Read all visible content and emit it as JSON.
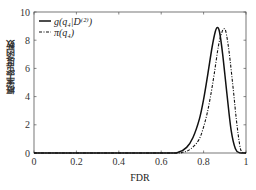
{
  "chart_data": {
    "type": "line",
    "title": "",
    "xlabel": "FDR",
    "ylabel": "概率密度函数",
    "xlim": [
      0,
      1
    ],
    "ylim": [
      0,
      10
    ],
    "xticks": [
      "0",
      "0.2",
      "0.4",
      "0.6",
      "0.8",
      "1"
    ],
    "yticks": [
      "0",
      "2",
      "4",
      "6",
      "8",
      "10"
    ],
    "grid": false,
    "legend_position": "upper left",
    "series": [
      {
        "name": "g(q4|D(2))",
        "style": "solid",
        "x": [
          0,
          0.6,
          0.68,
          0.72,
          0.75,
          0.78,
          0.8,
          0.82,
          0.84,
          0.855,
          0.865,
          0.875,
          0.89,
          0.91,
          0.93,
          0.95,
          0.97,
          1.0
        ],
        "y": [
          0,
          0,
          0.05,
          0.4,
          1.1,
          2.4,
          3.8,
          5.6,
          7.5,
          8.6,
          8.9,
          8.6,
          7.0,
          4.2,
          1.6,
          0.3,
          0.02,
          0
        ]
      },
      {
        "name": "π(q4)",
        "style": "dash-dot",
        "x": [
          0,
          0.62,
          0.7,
          0.74,
          0.78,
          0.81,
          0.83,
          0.85,
          0.87,
          0.885,
          0.895,
          0.905,
          0.92,
          0.94,
          0.955,
          0.97,
          0.98,
          1.0
        ],
        "y": [
          0,
          0,
          0.05,
          0.3,
          1.0,
          2.4,
          3.8,
          5.6,
          7.6,
          8.5,
          8.8,
          8.6,
          7.2,
          4.5,
          2.3,
          0.6,
          0.1,
          0
        ]
      }
    ]
  },
  "legend": {
    "items": [
      {
        "label": "g(q₄|D⁽²⁾)",
        "style": "solid"
      },
      {
        "label": "π(q₄)",
        "style": "dash-dot"
      }
    ]
  },
  "axes": {
    "xlabel": "FDR",
    "ylabel": "概率密度函数"
  }
}
